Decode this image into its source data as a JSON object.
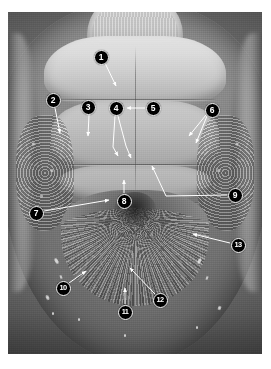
{
  "figure": {
    "type": "scanning-electron-micrograph",
    "background_color": "#ffffff",
    "plate": {
      "x": 8,
      "y": 12,
      "width": 254,
      "height": 342,
      "base_color": "#6d6d6d",
      "highlight_color": "#e2e2e2",
      "shadow_color": "#3a3a3a"
    },
    "callout_style": {
      "fill": "#000000",
      "text_color": "#ffffff",
      "ring_color": "#ffffff",
      "diameter": 15,
      "leader_color": "#ffffff"
    },
    "callouts": [
      {
        "id": "1",
        "label": "1",
        "cx": 101,
        "cy": 57,
        "leader": [
          [
            105,
            63
          ],
          [
            116,
            86
          ]
        ],
        "arrow": true
      },
      {
        "id": "2",
        "label": "2",
        "cx": 53,
        "cy": 100,
        "leader": [
          [
            55,
            108
          ],
          [
            60,
            133
          ]
        ],
        "arrow": true
      },
      {
        "id": "3",
        "label": "3",
        "cx": 88,
        "cy": 107,
        "leader": [
          [
            89,
            115
          ],
          [
            88,
            136
          ]
        ],
        "arrow": true
      },
      {
        "id": "4",
        "label": "4",
        "cx": 116,
        "cy": 108,
        "leader": [
          [
            115,
            116
          ],
          [
            113,
            147
          ],
          [
            118,
            156
          ]
        ],
        "arrow": true
      },
      {
        "id": "4b",
        "label": "",
        "cx": -100,
        "cy": -100,
        "leader": [
          [
            118,
            116
          ],
          [
            126,
            146
          ],
          [
            131,
            158
          ]
        ],
        "arrow": true
      },
      {
        "id": "5",
        "label": "5",
        "cx": 153,
        "cy": 108,
        "leader": [
          [
            145,
            108
          ],
          [
            127,
            108
          ]
        ],
        "arrow": true
      },
      {
        "id": "6",
        "label": "6",
        "cx": 212,
        "cy": 110,
        "leader": [
          [
            206,
            115
          ],
          [
            189,
            136
          ]
        ],
        "arrow": true
      },
      {
        "id": "6b",
        "label": "",
        "cx": -100,
        "cy": -100,
        "leader": [
          [
            207,
            116
          ],
          [
            196,
            143
          ]
        ],
        "arrow": true
      },
      {
        "id": "7",
        "label": "7",
        "cx": 36,
        "cy": 213,
        "leader": [
          [
            44,
            211
          ],
          [
            109,
            200
          ]
        ],
        "arrow": true
      },
      {
        "id": "8",
        "label": "8",
        "cx": 124,
        "cy": 201,
        "leader": [
          [
            124,
            193
          ],
          [
            124,
            180
          ]
        ],
        "arrow": true
      },
      {
        "id": "9",
        "label": "9",
        "cx": 235,
        "cy": 195,
        "leader": [
          [
            227,
            195
          ],
          [
            166,
            196
          ],
          [
            152,
            166
          ]
        ],
        "arrow": true
      },
      {
        "id": "10",
        "label": "10",
        "cx": 63,
        "cy": 288,
        "leader": [
          [
            69,
            283
          ],
          [
            86,
            271
          ]
        ],
        "arrow": true
      },
      {
        "id": "11",
        "label": "11",
        "cx": 125,
        "cy": 312,
        "leader": [
          [
            125,
            304
          ],
          [
            125,
            288
          ]
        ],
        "arrow": true
      },
      {
        "id": "12",
        "label": "12",
        "cx": 160,
        "cy": 300,
        "leader": [
          [
            155,
            294
          ],
          [
            130,
            268
          ]
        ],
        "arrow": true
      },
      {
        "id": "13",
        "label": "13",
        "cx": 238,
        "cy": 245,
        "leader": [
          [
            230,
            243
          ],
          [
            193,
            234
          ]
        ],
        "arrow": true
      }
    ],
    "specks": [
      {
        "x": 55,
        "y": 258,
        "w": 3,
        "h": 6,
        "r": -30
      },
      {
        "x": 60,
        "y": 275,
        "w": 2,
        "h": 4,
        "r": -20
      },
      {
        "x": 46,
        "y": 295,
        "w": 3,
        "h": 5,
        "r": -25
      },
      {
        "x": 52,
        "y": 312,
        "w": 2,
        "h": 3,
        "r": 0
      },
      {
        "x": 78,
        "y": 318,
        "w": 2,
        "h": 3,
        "r": 0
      },
      {
        "x": 198,
        "y": 258,
        "w": 3,
        "h": 6,
        "r": 28
      },
      {
        "x": 206,
        "y": 276,
        "w": 2,
        "h": 4,
        "r": 20
      },
      {
        "x": 218,
        "y": 306,
        "w": 3,
        "h": 4,
        "r": 22
      },
      {
        "x": 196,
        "y": 326,
        "w": 2,
        "h": 3,
        "r": 0
      },
      {
        "x": 124,
        "y": 334,
        "w": 2,
        "h": 3,
        "r": 0
      }
    ]
  }
}
